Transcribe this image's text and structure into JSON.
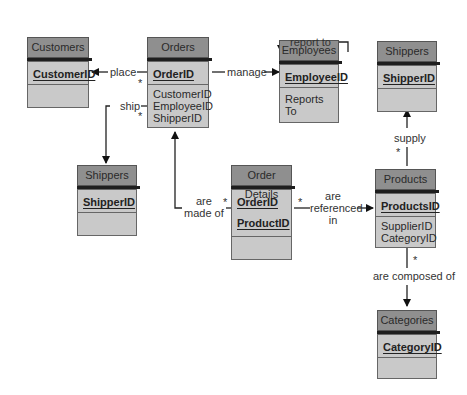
{
  "tables": {
    "customers": {
      "title": "Customers",
      "keys": [
        "CustomerID"
      ],
      "fields": []
    },
    "orders": {
      "title": "Orders",
      "keys": [
        "OrderID"
      ],
      "fields": [
        "CustomerID",
        "EmployeeID",
        "ShipperID"
      ]
    },
    "employees": {
      "title": "Employees",
      "keys": [
        "EmployeeID"
      ],
      "fields": [
        "Reports To"
      ]
    },
    "shippers_top": {
      "title": "Shippers",
      "keys": [
        "ShipperID"
      ],
      "fields": []
    },
    "shippers_left": {
      "title": "Shippers",
      "keys": [
        "ShipperID"
      ],
      "fields": []
    },
    "order_details": {
      "title": "Order Details",
      "keys": [
        "OrderID",
        "ProductID"
      ],
      "fields": []
    },
    "products": {
      "title": "Products",
      "keys": [
        "ProductsID"
      ],
      "fields": [
        "SupplierID",
        "CategoryID"
      ]
    },
    "categories": {
      "title": "Categories",
      "keys": [
        "CategoryID"
      ],
      "fields": []
    }
  },
  "relationships": {
    "place": "place",
    "manage": "manage",
    "report_to": "report to",
    "ship": "ship",
    "are_made_of_1": "are",
    "are_made_of_2": "made of",
    "are_referenced_in_1": "are",
    "are_referenced_in_2": "referenced",
    "are_referenced_in_3": "in",
    "supply": "supply",
    "are_composed_of": "are composed of",
    "many_marker": "*"
  }
}
